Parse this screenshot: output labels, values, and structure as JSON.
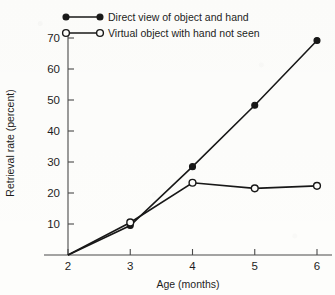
{
  "chart_data": {
    "type": "line",
    "title": "",
    "xlabel": "Age (months)",
    "ylabel": "Retrieval rate (percent)",
    "x": [
      2,
      3,
      4,
      5,
      6
    ],
    "xtick_labels": [
      "2",
      "3",
      "4",
      "5",
      "6"
    ],
    "ytick_labels": [
      "10",
      "20",
      "30",
      "40",
      "50",
      "60",
      "70"
    ],
    "ytick_values": [
      10,
      20,
      30,
      40,
      50,
      60,
      70
    ],
    "xlim": [
      2,
      6
    ],
    "ylim": [
      0,
      70
    ],
    "grid": false,
    "legend_position": "top-left",
    "series": [
      {
        "name": "Direct view of object and hand",
        "marker": "filled-circle",
        "values": [
          0,
          9.5,
          28.5,
          48.3,
          69.2
        ]
      },
      {
        "name": "Virtual object with hand not seen",
        "marker": "open-circle",
        "values": [
          0,
          10.5,
          23.3,
          21.5,
          22.3
        ]
      }
    ]
  },
  "axes": {
    "x_axis_title": "Age (months)",
    "y_axis_title": "Retrieval rate (percent)"
  },
  "legend": {
    "entries": [
      {
        "label": "Direct view of object and hand",
        "marker": "filled-circle"
      },
      {
        "label": "Virtual object with hand not seen",
        "marker": "open-circle"
      }
    ]
  }
}
